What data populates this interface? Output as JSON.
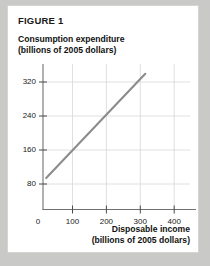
{
  "figure": {
    "label": "FIGURE 1"
  },
  "chart_data": {
    "type": "line",
    "title": "FIGURE 1",
    "ylabel_line1": "Consumption expenditure",
    "ylabel_line2": "(billions of 2005 dollars)",
    "xlabel_line1": "Disposable income",
    "xlabel_line2": "(billions of 2005 dollars)",
    "xlim": [
      0,
      460
    ],
    "ylim": [
      0,
      370
    ],
    "xticks": [
      0,
      100,
      200,
      300,
      400
    ],
    "xtick_labels": [
      "0",
      "100",
      "200",
      "300",
      "400"
    ],
    "yticks": [
      80,
      160,
      240,
      320
    ],
    "ytick_labels": [
      "80",
      "160",
      "240",
      "320"
    ],
    "grid": "both",
    "legend": "none",
    "series": [
      {
        "name": "Consumption function",
        "x": [
          10,
          320
        ],
        "y": [
          80,
          345
        ],
        "color": "#8c8c8c"
      }
    ],
    "line_color": "#8c8c8c",
    "grid_color": "#d6d6d6",
    "axis_color": "#6e6e6e"
  }
}
